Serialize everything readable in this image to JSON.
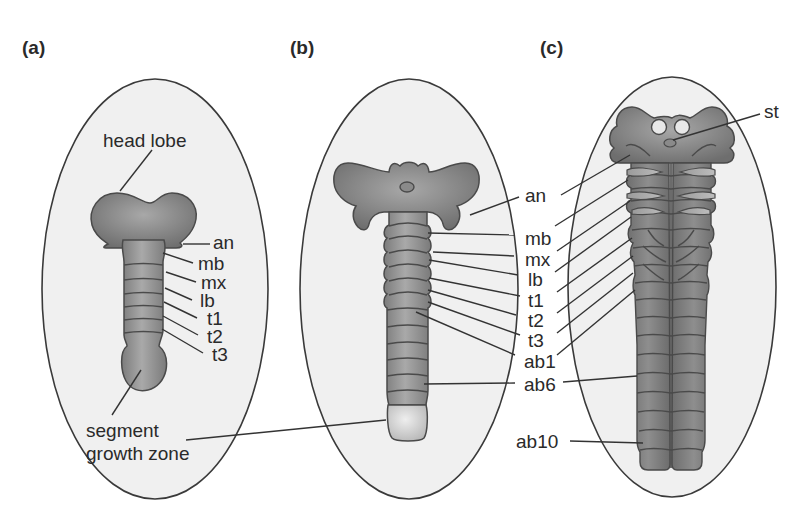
{
  "figure": {
    "panels": [
      {
        "id": "a",
        "letter": "(a)",
        "labels": {
          "head_lobe": "head lobe",
          "an": "an",
          "mb": "mb",
          "mx": "mx",
          "lb": "lb",
          "t1": "t1",
          "t2": "t2",
          "t3": "t3",
          "segment": "segment",
          "growth_zone": "growth zone"
        }
      },
      {
        "id": "b",
        "letter": "(b)",
        "labels": {
          "an": "an",
          "mb": "mb",
          "mx": "mx",
          "lb": "lb",
          "t1": "t1",
          "t2": "t2",
          "t3": "t3",
          "ab1": "ab1",
          "ab6": "ab6"
        }
      },
      {
        "id": "c",
        "letter": "(c)",
        "labels": {
          "st": "st",
          "ab10": "ab10"
        }
      }
    ]
  },
  "colors": {
    "egg_fill": "#f0f0f0",
    "outline": "#3a3a3a",
    "embryo_dark": "#7a7a7a",
    "embryo_light": "#b5b5b5",
    "growth_zone": "#d8d8d8",
    "text": "#2a2a2a"
  }
}
